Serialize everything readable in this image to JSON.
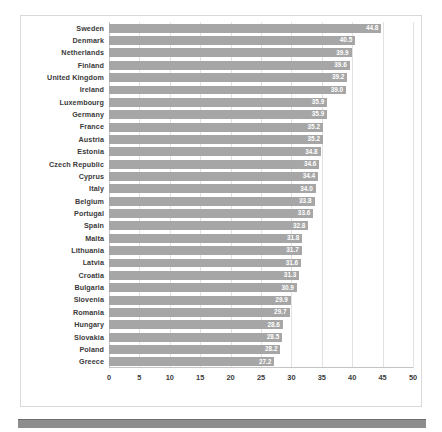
{
  "chart_data": {
    "type": "bar",
    "orientation": "horizontal",
    "title": "",
    "subtitle": "",
    "xlabel": "",
    "ylabel": "",
    "xlim": [
      0,
      50
    ],
    "xticks": [
      0,
      5,
      10,
      15,
      20,
      25,
      30,
      35,
      40,
      45,
      50
    ],
    "xtick_labels": [
      "0",
      "5",
      "10",
      "15",
      "20",
      "25",
      "30",
      "35",
      "40",
      "45",
      "50"
    ],
    "grid": true,
    "grid_axis": "x",
    "legend": false,
    "legend_position": "none",
    "data_labels": true,
    "bar_color": "#a6a6a6",
    "data_label_color": "#ffffff",
    "categories": [
      "Sweden",
      "Denmark",
      "Netherlands",
      "Finland",
      "United Kingdom",
      "Ireland",
      "Luxembourg",
      "Germany",
      "France",
      "Austria",
      "Estonia",
      "Czech Republic",
      "Cyprus",
      "Italy",
      "Belgium",
      "Portugal",
      "Spain",
      "Malta",
      "Lithuania",
      "Latvia",
      "Croatia",
      "Bulgaria",
      "Slovenia",
      "Romania",
      "Hungary",
      "Slovakia",
      "Poland",
      "Greece"
    ],
    "values": [
      44.8,
      40.5,
      39.9,
      39.6,
      39.2,
      39.0,
      35.9,
      35.9,
      35.2,
      35.2,
      34.8,
      34.6,
      34.4,
      34.0,
      33.8,
      33.6,
      32.8,
      31.8,
      31.7,
      31.6,
      31.3,
      30.9,
      29.9,
      29.7,
      28.6,
      28.5,
      28.2,
      27.2
    ],
    "value_labels": [
      "44.8",
      "40.5",
      "39.9",
      "39.6",
      "39.2",
      "39.0",
      "35.9",
      "35.9",
      "35.2",
      "35.2",
      "34.8",
      "34.6",
      "34.4",
      "34.0",
      "33.8",
      "33.6",
      "32.8",
      "31.8",
      "31.7",
      "31.6",
      "31.3",
      "30.9",
      "29.9",
      "29.7",
      "28.6",
      "28.5",
      "28.2",
      "27.2"
    ]
  }
}
